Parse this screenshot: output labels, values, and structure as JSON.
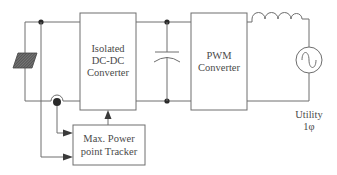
{
  "diagram": {
    "type": "block-diagram",
    "title": "",
    "blocks": {
      "dcdc": {
        "line1": "Isolated",
        "line2": "DC-DC",
        "line3": "Converter"
      },
      "pwm": {
        "line1": "PWM",
        "line2": "Converter"
      },
      "mppt": {
        "line1": "Max. Power",
        "line2": "point Tracker"
      }
    },
    "components": {
      "pv_array": "pv-array-icon",
      "capacitor": "capacitor-icon",
      "inductor": "inductor-icon",
      "ac_source": "ac-source-icon",
      "current_sensor": "current-sensor-icon"
    },
    "utility": {
      "label": "Utility",
      "phase": "1φ"
    },
    "colors": {
      "line": "#6e6e6e",
      "text": "#4a4a4a",
      "node": "#2a2a2a",
      "pv_fill": "#555555"
    }
  }
}
